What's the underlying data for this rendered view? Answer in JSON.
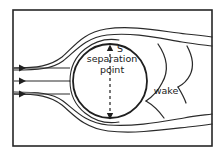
{
  "figure": {
    "frame": {
      "name": "figure-border",
      "x": 13,
      "y": 10,
      "width": 199,
      "height": 136,
      "stroke": "#262626",
      "stroke_width": 1.6,
      "fill": "#ffffff"
    },
    "background_color": "#ffffff",
    "ink_color": "#262626",
    "text_color": "#1a1a1a"
  },
  "labels": {
    "separation_marker": "S",
    "separation_line1": "separation",
    "separation_line2": "point",
    "wake": "wake"
  },
  "label_positions": {
    "separation_marker": {
      "x": 114,
      "y": 51,
      "font_size": 9
    },
    "separation_line1": {
      "x": 112,
      "y": 61,
      "font_size": 9
    },
    "separation_line2": {
      "x": 112,
      "y": 71,
      "font_size": 9
    },
    "wake": {
      "x": 165,
      "y": 93,
      "font_size": 9
    }
  },
  "cylinder": {
    "name": "cylinder-body",
    "center_x": 110,
    "center_y": 81,
    "radius": 37,
    "stroke": "#1f1f1f",
    "stroke_width": 1.7,
    "fill": "none"
  },
  "inflow_arrows": [
    {
      "name": "inflow-streamline-1",
      "x1": 14,
      "y1": 68,
      "x2": 70,
      "y2": 68,
      "arrow_x": 24
    },
    {
      "name": "inflow-streamline-2",
      "x1": 14,
      "y1": 81,
      "x2": 70,
      "y2": 81,
      "arrow_x": 24
    },
    {
      "name": "inflow-streamline-3",
      "x1": 14,
      "y1": 94,
      "x2": 70,
      "y2": 94,
      "arrow_x": 24
    }
  ],
  "separation_axis": {
    "name": "separation-axis-dashed",
    "x": 110,
    "y_top": 46,
    "y_bottom": 118,
    "dash": "3 3",
    "stroke": "#1f1f1f",
    "stroke_width": 1.2,
    "arrow_top": true,
    "arrow_bottom": true
  },
  "streamlines": [
    {
      "name": "streamline-upper-outer",
      "d": "M 14,68 C 38,68 50,66 62,57 C 74,47 82,33 106,29 C 132,25 160,31 186,34 C 196,35 205,36 212,37"
    },
    {
      "name": "streamline-upper-inner",
      "d": "M 14,70 C 38,70 52,69 63,61 C 75,52 84,38 107,35 C 133,32 158,38 182,42 C 194,44 204,45 212,46"
    },
    {
      "name": "streamline-lower-outer",
      "d": "M 14,94 C 38,94 50,96 62,105 C 74,115 84,128 108,131 C 134,134 162,130 188,127 C 198,126 206,125 212,124"
    },
    {
      "name": "streamline-lower-inner",
      "d": "M 14,92 C 38,92 52,93 63,101 C 75,110 85,123 108,125 C 134,127 160,122 184,118 C 195,116 205,115 212,114"
    },
    {
      "name": "streamline-body-upper",
      "d": "M 70,81 C 70,70 74,58 84,50 C 94,42 106,39 118,41"
    },
    {
      "name": "streamline-body-lower",
      "d": "M 70,81 C 70,92 74,104 84,112 C 94,120 106,123 118,121"
    },
    {
      "name": "wake-eddy-upper-left",
      "d": "M 158,44 C 166,56 168,70 162,82 C 158,90 152,96 146,100"
    },
    {
      "name": "wake-eddy-lower-left",
      "d": "M 146,100 C 152,104 158,110 163,117"
    },
    {
      "name": "wake-eddy-right",
      "d": "M 186,46 C 192,56 193,66 189,74 C 186,80 181,84 177,86"
    },
    {
      "name": "wake-eddy-right-lower",
      "d": "M 177,86 C 180,90 183,96 185,102"
    }
  ]
}
